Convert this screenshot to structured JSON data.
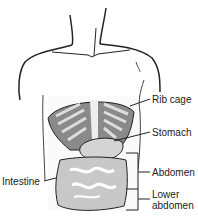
{
  "diagram": {
    "labels": {
      "rib_cage": "Rib cage",
      "stomach": "Stomach",
      "abdomen": "Abdomen",
      "lower_abdomen_line1": "Lower",
      "lower_abdomen_line2": "abdomen",
      "intestine": "Intestine"
    }
  }
}
